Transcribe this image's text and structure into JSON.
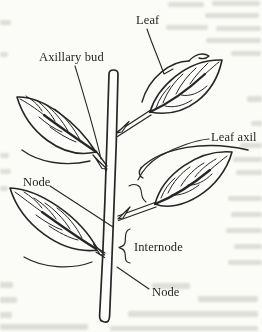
{
  "figure": {
    "labels": [
      {
        "id": "leaf",
        "text": "Leaf"
      },
      {
        "id": "axillary-bud",
        "text": "Axillary bud"
      },
      {
        "id": "leaf-axil",
        "text": "Leaf axil"
      },
      {
        "id": "node-upper",
        "text": "Node"
      },
      {
        "id": "internode",
        "text": "Internode"
      },
      {
        "id": "node-lower",
        "text": "Node"
      }
    ],
    "parts": [
      "stem",
      "leaf-upper-right",
      "leaf-upper-left",
      "leaf-middle-right",
      "leaf-lower-left",
      "axillary-bud-scales",
      "internode-brace"
    ],
    "colors": {
      "ink": "#262626",
      "paper": "#fbfbf8",
      "bleedthrough": "#b5b5ae"
    }
  }
}
